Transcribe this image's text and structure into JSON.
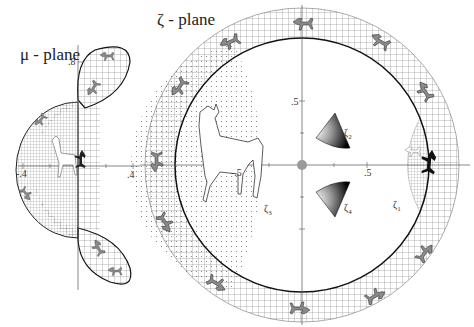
{
  "mu_plane": {
    "title": "μ - plane",
    "ticks": {
      "y_top": ".8",
      "x_right": ".4",
      "x_left": "-.4"
    }
  },
  "zeta_plane": {
    "title": "ζ - plane",
    "ticks": {
      "y_top": ".5",
      "x_left": "-.5",
      "x_right": ".5"
    },
    "region_labels": {
      "zeta1": {
        "sym": "ζ",
        "idx": "1"
      },
      "zeta2": {
        "sym": "ζ",
        "idx": "2"
      },
      "zeta3": {
        "sym": "ζ",
        "idx": "3"
      },
      "zeta4": {
        "sym": "ζ",
        "idx": "4"
      }
    }
  },
  "colors": {
    "line": "#222222",
    "grid": "#555555",
    "fill_gray": "#8a8a8a",
    "fill_dark": "#1a1a1a",
    "stipple": "#666666"
  }
}
